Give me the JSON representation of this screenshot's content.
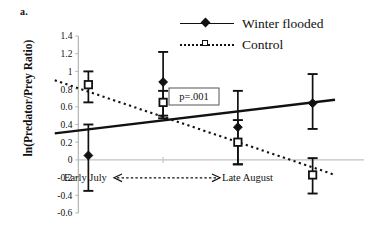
{
  "panel": {
    "letter": "a."
  },
  "legend": {
    "items": [
      {
        "label": "Winter flooded",
        "marker": "filled-diamond",
        "line": "solid",
        "color": "#111111"
      },
      {
        "label": "Control",
        "marker": "open-square",
        "line": "dotted",
        "color": "#111111"
      }
    ]
  },
  "annotations": {
    "pvalue": "p=.001",
    "time_left": "Early July",
    "time_arrow": "<------------------------->",
    "time_right": "Late August"
  },
  "chart_data": {
    "type": "line",
    "title": "",
    "xlabel": "",
    "ylabel": "ln(Predator/Prey Ratio)",
    "ylim": [
      -0.6,
      1.4
    ],
    "yticks": [
      1.4,
      1.2,
      1,
      0.8,
      0.6,
      0.4,
      0.2,
      0,
      -0.2,
      -0.4,
      -0.6
    ],
    "ytick_labels": [
      "1.4",
      "1.2",
      "1",
      "0.8",
      "0.6",
      "0.4",
      "0.2",
      "0",
      "-0.2",
      "-0.4",
      "-0.6"
    ],
    "xlim": [
      0.5,
      4.5
    ],
    "x": [
      1,
      2,
      3,
      4
    ],
    "xtick_labels": [
      "",
      "",
      "",
      ""
    ],
    "grid": false,
    "legend_position": "top-right",
    "series": [
      {
        "name": "Winter flooded",
        "marker": "filled-diamond",
        "line": "solid",
        "values": [
          0.05,
          0.88,
          0.37,
          0.64
        ],
        "err_low": [
          -0.35,
          0.5,
          -0.05,
          0.35
        ],
        "err_high": [
          0.4,
          1.22,
          0.78,
          0.97
        ],
        "trend": {
          "x": [
            0.55,
            4.3
          ],
          "y": [
            0.3,
            0.68
          ]
        }
      },
      {
        "name": "Control",
        "marker": "open-square",
        "line": "dotted",
        "values": [
          0.85,
          0.65,
          0.2,
          -0.17
        ],
        "err_low": [
          0.65,
          0.47,
          -0.05,
          -0.38
        ],
        "err_high": [
          1.0,
          0.78,
          0.45,
          0.02
        ],
        "trend": {
          "x": [
            0.55,
            4.3
          ],
          "y": [
            0.9,
            -0.17
          ]
        }
      }
    ]
  }
}
